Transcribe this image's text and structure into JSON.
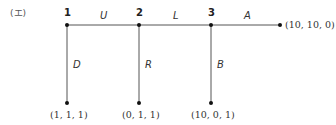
{
  "panel_label": "(エ)",
  "nodes": [
    {
      "id": "1",
      "label": "1"
    },
    {
      "id": "2",
      "label": "2"
    },
    {
      "id": "3",
      "label": "3"
    }
  ],
  "horizontal_edges": [
    {
      "from": "1",
      "to": "2",
      "label": "U"
    },
    {
      "from": "2",
      "to": "3",
      "label": "L"
    },
    {
      "from": "3",
      "to": "end",
      "label": "A"
    }
  ],
  "vertical_edges": [
    {
      "from": "1",
      "label": "D"
    },
    {
      "from": "2",
      "label": "R"
    },
    {
      "from": "3",
      "label": "B"
    }
  ],
  "endpoints": {
    "right": "(10, 10, 0)",
    "below_1": "(1, 1, 1)",
    "below_2": "(0, 1, 1)",
    "below_3": "(10, 0, 1)"
  },
  "colors": {
    "line": "#555555",
    "dot": "#111111"
  }
}
